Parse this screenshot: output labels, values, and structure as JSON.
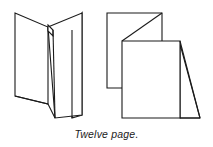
{
  "figure": {
    "caption": "Twelve page.",
    "title": "Twelve page.",
    "colors": {
      "stroke": "#1b1b1b",
      "fill": "#ffffff",
      "background": "#ffffff",
      "caption_text": "#1b1b1b"
    },
    "stroke_width": 1.1,
    "diagrams": [
      {
        "name": "left-fold-view",
        "label": "",
        "description": "Twelve page fold shown standing, accordion folded, viewed from the spine side"
      },
      {
        "name": "right-fold-view",
        "label": "",
        "description": "Twelve page fold shown part opened with panels stepped back"
      }
    ]
  }
}
